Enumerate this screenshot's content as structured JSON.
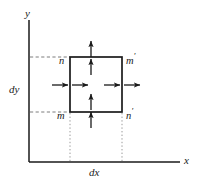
{
  "figure": {
    "axes": {
      "y_label": "y",
      "x_label": "x",
      "dy_label": "dy",
      "dx_label": "dx",
      "x_axis": {
        "x1": 29,
        "y1": 162,
        "x2": 180,
        "y2": 162
      },
      "y_axis": {
        "x1": 29,
        "y1": 20,
        "x2": 29,
        "y2": 162
      }
    },
    "box": {
      "left": 70,
      "right": 122,
      "top": 57,
      "bottom": 112,
      "stroke": "#1a1a1a",
      "stroke_width": 1.6
    },
    "corner_labels": [
      {
        "name": "top-left",
        "text": "n",
        "prime": "",
        "x": 59,
        "y": 52
      },
      {
        "name": "top-right",
        "text": "m",
        "prime": "′",
        "x": 126,
        "y": 52
      },
      {
        "name": "bottom-left",
        "text": "m",
        "prime": "",
        "x": 57,
        "y": 107
      },
      {
        "name": "bottom-right",
        "text": "n",
        "prime": "′",
        "x": 126,
        "y": 107
      }
    ],
    "arrows": [
      {
        "name": "left-outer-horizontal",
        "direction": "right",
        "x1": 52,
        "y1": 85,
        "x2": 68,
        "y2": 85
      },
      {
        "name": "left-inner-horizontal",
        "direction": "right",
        "x1": 72,
        "y1": 85,
        "x2": 88,
        "y2": 85
      },
      {
        "name": "right-inner-horizontal",
        "direction": "right",
        "x1": 104,
        "y1": 85,
        "x2": 120,
        "y2": 85
      },
      {
        "name": "right-outer-horizontal",
        "direction": "right",
        "x1": 124,
        "y1": 85,
        "x2": 140,
        "y2": 85
      },
      {
        "name": "top-outer-vertical",
        "direction": "up",
        "x1": 91,
        "y1": 57,
        "x2": 91,
        "y2": 41
      },
      {
        "name": "top-inner-vertical",
        "direction": "up",
        "x1": 91,
        "y1": 75,
        "x2": 91,
        "y2": 59
      },
      {
        "name": "bottom-inner-vertical",
        "direction": "up",
        "x1": 91,
        "y1": 110,
        "x2": 91,
        "y2": 94
      },
      {
        "name": "bottom-outer-vertical",
        "direction": "up",
        "x1": 91,
        "y1": 128,
        "x2": 91,
        "y2": 112
      }
    ],
    "guides": [
      {
        "name": "top-horizontal-guide",
        "style": "dashed",
        "x1": 30,
        "y1": 57,
        "x2": 70,
        "y2": 57
      },
      {
        "name": "bottom-horizontal-guide",
        "style": "dashed",
        "x1": 30,
        "y1": 112,
        "x2": 70,
        "y2": 112
      },
      {
        "name": "left-vertical-guide",
        "style": "dotted",
        "x1": 70,
        "y1": 113,
        "x2": 70,
        "y2": 161
      },
      {
        "name": "right-vertical-guide",
        "style": "dotted",
        "x1": 122,
        "y1": 113,
        "x2": 122,
        "y2": 161
      }
    ],
    "colors": {
      "ink": "#1a1a1a",
      "guide": "#8c8c8c",
      "background": "#ffffff"
    }
  }
}
